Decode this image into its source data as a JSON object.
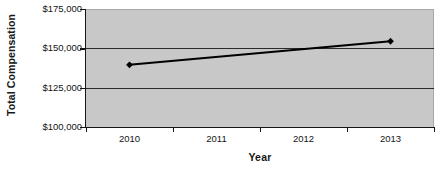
{
  "chart_data": {
    "type": "line",
    "title": "",
    "xlabel": "Year",
    "ylabel": "Total Compensation",
    "categories": [
      "2010",
      "2011",
      "2012",
      "2013"
    ],
    "x": [
      2010,
      2011,
      2012,
      2013
    ],
    "series": [
      {
        "name": "Total Compensation",
        "values": [
          139500,
          null,
          null,
          154500
        ],
        "marker": "diamond",
        "color": "#000000",
        "line_width": 2
      }
    ],
    "ylim": [
      100000,
      175000
    ],
    "ytick_values": [
      175000,
      150000,
      125000,
      100000
    ],
    "ytick_labels": [
      "$175,000",
      "$150,000",
      "$125,000",
      "$100,000"
    ],
    "xtick_labels": [
      "2010",
      "2011",
      "2012",
      "2013"
    ],
    "grid": true,
    "grid_axis": "y",
    "legend": false,
    "legend_position": "none",
    "plot_background": "#c8c8c8",
    "figure_background": "#ffffff",
    "axis_color": "#151515",
    "gridline_color": "#2b2b2b",
    "annotations": []
  },
  "axes": {
    "y_title": "Total Compensation",
    "x_title": "Year",
    "y_labels": [
      "$175,000",
      "$150,000",
      "$125,000",
      "$100,000"
    ],
    "x_labels": [
      "2010",
      "2011",
      "2012",
      "2013"
    ]
  }
}
